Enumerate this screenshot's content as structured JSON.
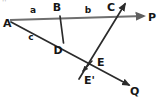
{
  "figure": {
    "background_color": "#ffffff",
    "ink_color": "#2b2b2b",
    "ray_ap_color": "#6f6f6f",
    "corner_mark": "''",
    "points": [
      {
        "id": "A",
        "label": "A",
        "x": 10,
        "y": 21,
        "label_x": 4,
        "label_y": 25
      },
      {
        "id": "B",
        "label": "B",
        "x": 60,
        "y": 14,
        "label_x": 56,
        "label_y": 12
      },
      {
        "id": "C",
        "label": "C",
        "x": 113,
        "y": 13,
        "label_x": 109,
        "label_y": 11
      },
      {
        "id": "D",
        "label": "D",
        "x": 62,
        "y": 41,
        "label_x": 56,
        "label_y": 52
      },
      {
        "id": "E",
        "label": "E",
        "x": 93,
        "y": 61,
        "label_x": 96,
        "label_y": 62
      },
      {
        "id": "E'",
        "label": "E'",
        "x": 83,
        "y": 73,
        "label_x": 84,
        "label_y": 81
      },
      {
        "id": "P",
        "label": "P",
        "x": 150,
        "y": 17,
        "label_x": 148,
        "label_y": 21
      },
      {
        "id": "Q",
        "label": "Q",
        "x": 134,
        "y": 88,
        "label_x": 131,
        "label_y": 93
      }
    ],
    "segment_labels": [
      {
        "id": "a",
        "label": "a",
        "x": 33,
        "y": 12,
        "between": "A-B"
      },
      {
        "id": "b",
        "label": "b",
        "x": 88,
        "y": 12,
        "between": "B-C"
      },
      {
        "id": "c",
        "label": "c",
        "x": 31,
        "y": 37,
        "between": "A-D"
      }
    ],
    "lines": [
      {
        "id": "ray-AP",
        "from": "A",
        "to": "P",
        "x1": 10,
        "y1": 20,
        "x2": 146,
        "y2": 16,
        "arrow_at_end": true,
        "color": "#6f6f6f",
        "width": 2.0
      },
      {
        "id": "ray-AQ",
        "from": "A",
        "to": "Q",
        "x1": 11,
        "y1": 22,
        "x2": 131,
        "y2": 86,
        "arrow_at_end": true,
        "color": "#2b2b2b",
        "width": 1.6
      },
      {
        "id": "segment-BD",
        "from": "B",
        "to": "D",
        "x1": 60,
        "y1": 16,
        "x2": 63,
        "y2": 42,
        "arrow_at_end": false,
        "color": "#2b2b2b",
        "width": 1.6
      },
      {
        "id": "transversal-E-C",
        "from": "E'",
        "to": "top-right",
        "x1": 80,
        "y1": 77,
        "x2": 126,
        "y2": 2,
        "arrow_at_end": true,
        "color": "#2b2b2b",
        "width": 1.6
      },
      {
        "id": "arrow-E-prime",
        "from": "E",
        "to": "E'",
        "x1": 93,
        "y1": 61,
        "x2": 82,
        "y2": 72,
        "arrow_at_end": true,
        "color": "#2b2b2b",
        "width": 1.4
      }
    ]
  }
}
